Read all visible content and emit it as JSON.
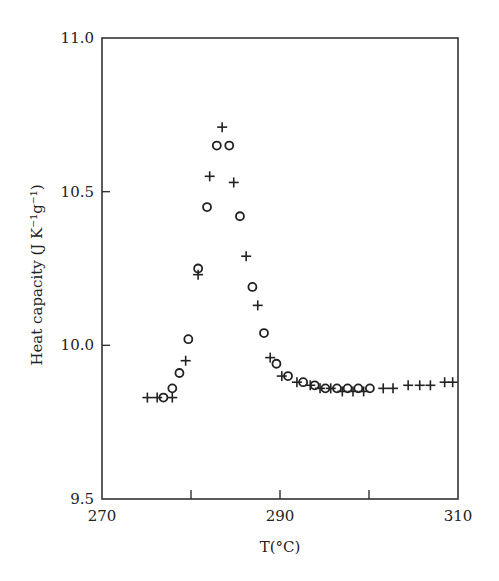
{
  "chart_data": {
    "type": "scatter",
    "title": "",
    "xlabel": "T(°C)",
    "ylabel": "Heat capacity (J K⁻¹g⁻¹)",
    "xlim": [
      270,
      310
    ],
    "ylim": [
      9.5,
      11.0
    ],
    "x_ticks": [
      270,
      280,
      290,
      300,
      310
    ],
    "x_tick_labels": [
      "270",
      "",
      "290",
      "",
      "310"
    ],
    "y_ticks": [
      9.5,
      10.0,
      10.5,
      11.0
    ],
    "y_tick_labels": [
      "9.5",
      "10.0",
      "10.5",
      "11.0"
    ],
    "grid": false,
    "legend": null,
    "series": [
      {
        "name": "plus",
        "marker": "+",
        "points": [
          [
            275.1,
            9.83
          ],
          [
            276.2,
            9.83
          ],
          [
            277.9,
            9.83
          ],
          [
            279.4,
            9.95
          ],
          [
            280.8,
            10.23
          ],
          [
            282.1,
            10.55
          ],
          [
            283.5,
            10.71
          ],
          [
            284.8,
            10.53
          ],
          [
            286.2,
            10.29
          ],
          [
            287.5,
            10.13
          ],
          [
            288.9,
            9.96
          ],
          [
            290.2,
            9.9
          ],
          [
            291.9,
            9.88
          ],
          [
            293.4,
            9.87
          ],
          [
            294.5,
            9.86
          ],
          [
            295.7,
            9.86
          ],
          [
            297.0,
            9.85
          ],
          [
            298.2,
            9.85
          ],
          [
            299.4,
            9.85
          ],
          [
            301.6,
            9.86
          ],
          [
            302.7,
            9.86
          ],
          [
            304.4,
            9.87
          ],
          [
            305.7,
            9.87
          ],
          [
            306.9,
            9.87
          ],
          [
            308.5,
            9.88
          ],
          [
            309.4,
            9.88
          ]
        ]
      },
      {
        "name": "circle",
        "marker": "o",
        "points": [
          [
            276.9,
            9.83
          ],
          [
            277.9,
            9.86
          ],
          [
            278.7,
            9.91
          ],
          [
            279.7,
            10.02
          ],
          [
            280.8,
            10.25
          ],
          [
            281.8,
            10.45
          ],
          [
            282.9,
            10.65
          ],
          [
            284.3,
            10.65
          ],
          [
            285.5,
            10.42
          ],
          [
            286.9,
            10.19
          ],
          [
            288.2,
            10.04
          ],
          [
            289.6,
            9.94
          ],
          [
            290.9,
            9.9
          ],
          [
            292.6,
            9.88
          ],
          [
            293.9,
            9.87
          ],
          [
            295.1,
            9.86
          ],
          [
            296.4,
            9.86
          ],
          [
            297.6,
            9.86
          ],
          [
            298.8,
            9.86
          ],
          [
            300.1,
            9.86
          ]
        ]
      }
    ]
  },
  "layout": {
    "plot": {
      "left": 102,
      "top": 38,
      "right": 458,
      "bottom": 499
    },
    "colors": {
      "axis": "#333333",
      "marker": "#222222",
      "background": "#ffffff"
    }
  }
}
